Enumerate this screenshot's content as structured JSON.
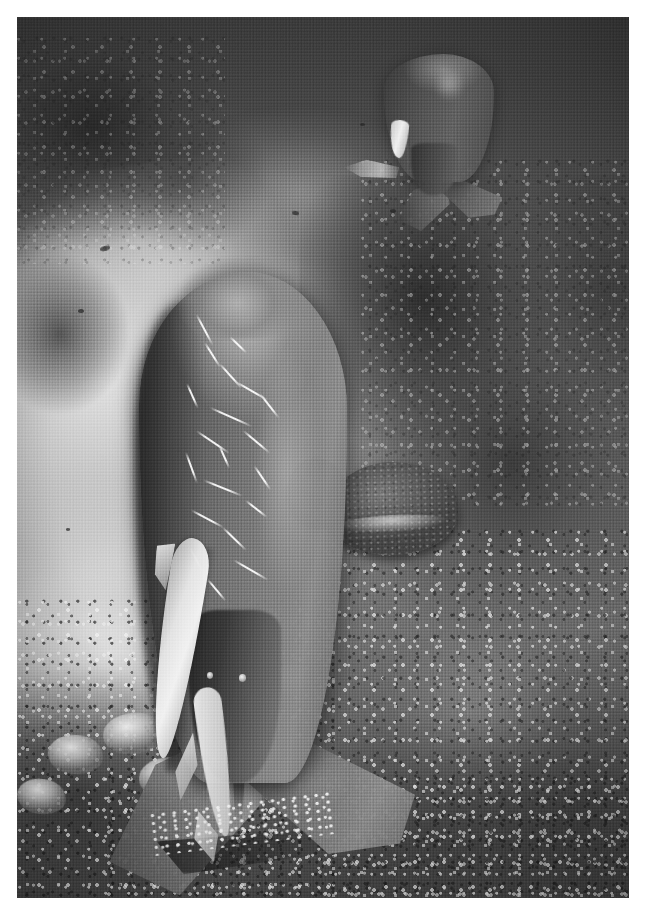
{
  "image": {
    "kind": "photograph",
    "medium": "black-and-white underwater photograph",
    "title": "Two dugongs over a coral reef and sandy channel",
    "orientation": "portrait",
    "width_px": 645,
    "height_px": 920,
    "plate": {
      "left_px": 17,
      "top_px": 17,
      "width_px": 612,
      "height_px": 881,
      "border": "none",
      "page_background": "#ffffff"
    }
  },
  "palette": {
    "page_white": "#ffffff",
    "water_dark": "#41413f",
    "water_mid": "#63625f",
    "sand_bright": "#e2e0da",
    "sand_mid": "#c5c3bd",
    "reef_dark": "#2e2e2d",
    "reef_mid": "#5a5a57",
    "animal_dark": "#3a3a38",
    "animal_mid": "#70706c",
    "animal_light": "#908f8a",
    "scar_white": "#faf9f4",
    "remora_white": "#f6f4ee"
  },
  "subjects": {
    "foreground_dugong": {
      "name": "dugong-foreground",
      "description": "Large dugong seen from above and behind, swimming away from the camera, body angled down-left, broad fluke at the bottom of the frame",
      "markings": "numerous pale white scratch scars across the back and flanks",
      "scar_count": 20,
      "position": "center-left, lower two thirds"
    },
    "background_dugong": {
      "name": "dugong-background",
      "description": "Second, smaller dugong further away near the top of the frame, also viewed from behind with its fluke spread below it",
      "position": "upper right"
    },
    "remora_primary": {
      "name": "remora-primary",
      "description": "Bright silvery remora (suckerfish) riding along the left flank of the foreground dugong"
    },
    "remora_secondary": {
      "name": "remora-secondary",
      "description": "Slimmer second remora trailing near the tail stock of the foreground dugong"
    },
    "remora_background": {
      "name": "remora-background",
      "description": "Small pale remora on the underside of the distant dugong"
    }
  },
  "environment": {
    "seafloor": {
      "name": "sand-channel",
      "description": "Bright pale sand channel winding diagonally from upper centre down to the lower left"
    },
    "reef_right": {
      "name": "coral-reef-mass-right",
      "description": "Dark, heavily textured coral reef bommie occupying the right half of the frame"
    },
    "reef_topleft": {
      "name": "coral-reef-mass-upper-left",
      "description": "Shadowed reef and rubble along the upper-left edge"
    },
    "table_coral": {
      "name": "table-coral-acropora",
      "description": "Flat plate (table) Acropora coral on the reef at mid-right, with a second smaller plate beside it"
    },
    "coral_heads": {
      "name": "coral-heads-lower-left",
      "description": "Cluster of bright white branching and encrusting coral heads along the lower-left reef edge",
      "count": 8
    },
    "rubble": {
      "name": "coral-rubble-field",
      "description": "Speckled coral rubble and small bommies covering the lower and right portions of the seafloor"
    },
    "water_column": {
      "name": "open-water",
      "description": "Dark open water filling the top of the frame and the upper right corner"
    },
    "particles": {
      "name": "suspended-particles",
      "description": "Scattered small dark specks of debris and tiny fish suspended in the water over the sand"
    }
  },
  "caption": ""
}
